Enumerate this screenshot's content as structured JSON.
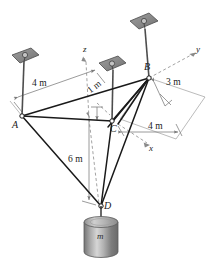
{
  "figure": {
    "type": "engineering-statics-free-body-diagram",
    "background": "#ffffff",
    "ink_color": "#1a1a1a",
    "dim_color": "#808080",
    "plate_fill": "#8c8c8c",
    "plate_stroke": "#4d4d4d",
    "mass_light": "#d8d8d8",
    "mass_dark": "#6e6e6e"
  },
  "points": [
    {
      "id": "A",
      "label": "A",
      "x": 22,
      "y": 116
    },
    {
      "id": "B",
      "label": "B",
      "x": 149,
      "y": 78
    },
    {
      "id": "C",
      "label": "C",
      "x": 112,
      "y": 121
    },
    {
      "id": "D",
      "label": "D",
      "x": 101,
      "y": 206
    }
  ],
  "axes": [
    {
      "id": "z",
      "label": "z",
      "tip_x": 85,
      "tip_y": 57,
      "base_x": 89,
      "base_y": 119
    },
    {
      "id": "y",
      "label": "y",
      "tip_x": 196,
      "tip_y": 52,
      "base_x": 149,
      "base_y": 78
    },
    {
      "id": "x",
      "label": "x",
      "tip_x": 150,
      "tip_y": 145,
      "base_x": 118,
      "base_y": 124
    }
  ],
  "axis_labels": {
    "z": "z",
    "y": "y",
    "x": "x"
  },
  "dimensions": [
    {
      "id": "dim-4m-left",
      "label": "4 m",
      "x": 38,
      "y": 85
    },
    {
      "id": "dim-1m",
      "label": "1 m",
      "x": 92,
      "y": 96
    },
    {
      "id": "dim-3m",
      "label": "3 m",
      "x": 172,
      "y": 84
    },
    {
      "id": "dim-4m-right",
      "label": "4 m",
      "x": 155,
      "y": 127
    },
    {
      "id": "dim-6m",
      "label": "6 m",
      "x": 76,
      "y": 160
    }
  ],
  "mass": {
    "id": "hanging-mass",
    "label": "m",
    "label_x": 103,
    "label_y": 237
  },
  "plates": [
    {
      "id": "plate-A",
      "cx": 25,
      "cy": 57,
      "pole_to_x": 22,
      "pole_to_y": 116
    },
    {
      "id": "plate-C",
      "cx": 112,
      "cy": 66,
      "pole_to_x": 112,
      "pole_to_y": 121
    },
    {
      "id": "plate-B",
      "cx": 143,
      "cy": 24,
      "pole_to_x": 149,
      "pole_to_y": 78
    }
  ]
}
